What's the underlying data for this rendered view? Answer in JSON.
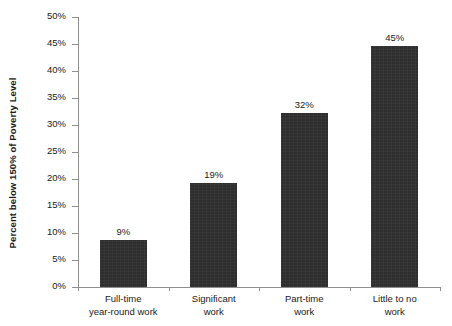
{
  "chart_data": {
    "type": "bar",
    "title": "",
    "xlabel": "",
    "ylabel": "Percent below 150% of Poverty Level",
    "ylim": [
      0,
      50
    ],
    "grid": false,
    "legend": null,
    "categories": [
      "Full-time year-round work",
      "Significant work",
      "Part-time work",
      "Little to no work"
    ],
    "category_lines": [
      [
        "Full-time",
        "year-round work"
      ],
      [
        "Significant",
        "work"
      ],
      [
        "Part-time",
        "work"
      ],
      [
        "Little to no",
        "work"
      ]
    ],
    "values": [
      9,
      19,
      32,
      45
    ],
    "data_labels": [
      "9%",
      "19%",
      "32%",
      "45%"
    ],
    "plotted_values": [
      8.7,
      19.3,
      32.3,
      44.6
    ],
    "yticks": [
      50,
      45,
      40,
      35,
      30,
      25,
      20,
      15,
      10,
      5,
      0
    ],
    "ytick_labels": [
      "50%",
      "45%",
      "40%",
      "35%",
      "30%",
      "25%",
      "20%",
      "15%",
      "10%",
      "5%",
      "0%"
    ],
    "bar_color": "#2e2e2e",
    "background_color": "#ffffff",
    "axis_color": "#8f8f8f"
  }
}
